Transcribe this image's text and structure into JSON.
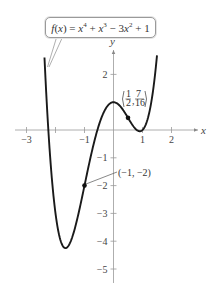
{
  "chart_data": {
    "type": "line",
    "title": "",
    "function_label": "f(x) = x^4 + x^3 - 3x^2 + 1",
    "coefficients": {
      "x4": 1,
      "x3": 1,
      "x2": -3,
      "x1": 0,
      "x0": 1
    },
    "xlabel": "x",
    "ylabel": "y",
    "x_domain": [
      -2.38,
      1.5
    ],
    "xlim": [
      -3.4,
      2.6
    ],
    "ylim": [
      -5.4,
      3.0
    ],
    "x_ticks": [
      -3,
      -2,
      -1,
      1,
      2
    ],
    "x_tick_labels": [
      "-3",
      "",
      "-1",
      "1",
      "2"
    ],
    "y_ticks": [
      2,
      -1,
      -2,
      -3,
      -4,
      -5
    ],
    "y_tick_labels": [
      "2",
      "-1",
      "-2",
      "-3",
      "-4",
      "-5"
    ],
    "grid": false,
    "annotated_points": [
      {
        "x": 0.5,
        "y": 0.4375,
        "label": "(1/2, 7/16)"
      },
      {
        "x": -1,
        "y": -2,
        "label": "(-1, -2)"
      }
    ],
    "color": "#1a1a1a"
  },
  "callout": {
    "f": "f",
    "x": "x",
    "eq_text": "f(x) = x4 + x3 − 3x2 + 1"
  },
  "labels": {
    "point_a_num": "1",
    "point_a_den": "2",
    "point_a_num2": "7",
    "point_a_den2": "16",
    "point_b": "(−1, −2)",
    "x_axis": "x",
    "y_axis": "y"
  }
}
